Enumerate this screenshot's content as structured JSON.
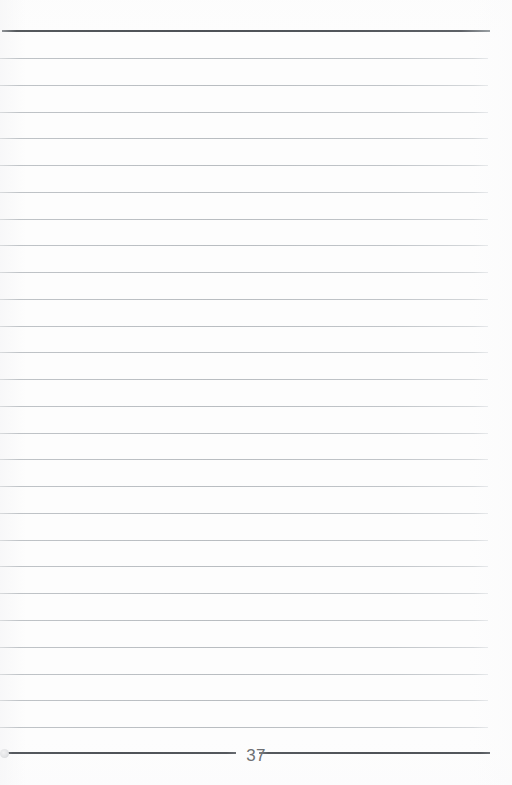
{
  "page": {
    "kind": "scanned-ruled-notebook-page",
    "width": 512,
    "height": 785,
    "paper_color": "#fdfdfd",
    "page_number": "37"
  },
  "header": {
    "rule": {
      "name": "top-border-rule",
      "y": 31,
      "x_start": 2,
      "x_end": 490,
      "thickness": 2,
      "color": "#53575c"
    }
  },
  "body": {
    "rule_color": "#bdc1c5",
    "rule_thickness": 1,
    "rule_x_start": 0,
    "rule_x_end": 488,
    "first_rule_y": 58,
    "rule_spacing": 26.76,
    "rule_count": 26,
    "rule_y_positions": [
      58,
      84.8,
      111.5,
      138.3,
      165.0,
      191.8,
      218.6,
      245.3,
      272.1,
      298.8,
      325.6,
      352.4,
      379.1,
      405.9,
      432.6,
      459.4,
      486.2,
      512.9,
      539.7,
      566.4,
      593.2,
      620.0,
      646.7,
      673.5,
      700.2,
      727.0
    ]
  },
  "footer": {
    "rule": {
      "name": "bottom-border-rule",
      "y": 753,
      "x_start": 3,
      "x_end": 490,
      "thickness": 2,
      "color": "#52565b",
      "gap_start": 236,
      "gap_end": 259
    },
    "page_number": {
      "value": "37",
      "center_x": 247,
      "baseline_y": 764,
      "color": "#6e7073",
      "font_size": 17
    },
    "left_cap": {
      "name": "scan-edge-artifact",
      "x": 0,
      "y": 749,
      "diameter": 9,
      "color": "#e2e3e5"
    }
  }
}
